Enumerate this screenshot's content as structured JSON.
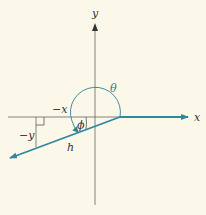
{
  "diagram": {
    "type": "vector-angle-diagram",
    "colors": {
      "background": "#fbf8e9",
      "axis": "#555555",
      "vector": "#2f87a0",
      "arc": "#2f7f9a",
      "text": "#333333"
    },
    "labels": {
      "x_axis": "x",
      "y_axis": "y",
      "theta": "θ",
      "phi": "ϕ",
      "neg_x": "−x",
      "neg_y": "−y",
      "hypotenuse": "h"
    }
  }
}
